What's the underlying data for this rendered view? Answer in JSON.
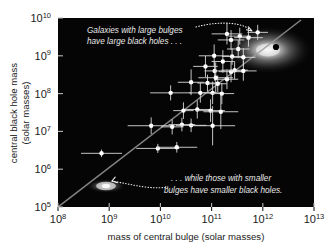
{
  "figure": {
    "name": "black-hole-mass-vs-bulge-mass-scatter",
    "background_color": "#ffffff",
    "plot_background_color": "#050505"
  },
  "axes": {
    "x_title": "mass of central bulge (solar masses)",
    "y_title_line1": "central black hole mass",
    "y_title_line2": "(solar masses)",
    "x_ticks": [
      {
        "mantissa": "10",
        "exponent": "8",
        "value": 8
      },
      {
        "mantissa": "10",
        "exponent": "9",
        "value": 9
      },
      {
        "mantissa": "10",
        "exponent": "10",
        "value": 10
      },
      {
        "mantissa": "10",
        "exponent": "11",
        "value": 11
      },
      {
        "mantissa": "10",
        "exponent": "12",
        "value": 12
      },
      {
        "mantissa": "10",
        "exponent": "13",
        "value": 13
      }
    ],
    "y_ticks": [
      {
        "mantissa": "10",
        "exponent": "10",
        "value": 10
      },
      {
        "mantissa": "10",
        "exponent": "9",
        "value": 9
      },
      {
        "mantissa": "10",
        "exponent": "8",
        "value": 8
      },
      {
        "mantissa": "10",
        "exponent": "7",
        "value": 7
      },
      {
        "mantissa": "10",
        "exponent": "6",
        "value": 6
      },
      {
        "mantissa": "10",
        "exponent": "5",
        "value": 5
      }
    ]
  },
  "annotations": {
    "top": {
      "line1": "Galaxies with large bulges",
      "line2": "have large black holes . . ."
    },
    "bottom": {
      "line1": ". . . while those with smaller",
      "line2": "bulges have smaller black holes."
    }
  },
  "chart_data": {
    "type": "scatter",
    "title": "",
    "xlabel": "mass of central bulge (solar masses)",
    "ylabel": "central black hole mass (solar masses)",
    "xscale": "log10",
    "yscale": "log10",
    "xlim": [
      8,
      13
    ],
    "ylim": [
      5,
      10
    ],
    "grid": false,
    "legend": null,
    "point_color": "#ffffff",
    "errorbar_color": "#d8d8d8",
    "fit_line": {
      "label": "best-fit relation",
      "color": "#9a9a9a",
      "x_log": [
        8.0,
        12.85
      ],
      "y_log": [
        5.0,
        9.95
      ]
    },
    "images": [
      {
        "name": "elliptical-galaxy-thumbnail",
        "x_log": 12.05,
        "y_log": 9.35,
        "note": "large elliptical galaxy with central black hole marker"
      },
      {
        "name": "spiral-galaxy-thumbnail",
        "x_log": 8.95,
        "y_log": 5.55,
        "note": "small spiral galaxy"
      }
    ],
    "points": [
      {
        "x_log": 8.85,
        "y_log": 6.42,
        "xerr": 0.4,
        "yerr": 0.1
      },
      {
        "x_log": 9.95,
        "y_log": 6.55,
        "xerr": 0.42,
        "yerr": 0.12
      },
      {
        "x_log": 10.32,
        "y_log": 6.58,
        "xerr": 0.4,
        "yerr": 0.14
      },
      {
        "x_log": 9.82,
        "y_log": 7.15,
        "xerr": 0.46,
        "yerr": 0.22
      },
      {
        "x_log": 10.23,
        "y_log": 7.12,
        "xerr": 0.22,
        "yerr": 0.2
      },
      {
        "x_log": 10.42,
        "y_log": 7.18,
        "xerr": 0.26,
        "yerr": 0.18
      },
      {
        "x_log": 10.6,
        "y_log": 7.16,
        "xerr": 0.3,
        "yerr": 0.18
      },
      {
        "x_log": 11.02,
        "y_log": 7.15,
        "xerr": 0.44,
        "yerr": 0.52
      },
      {
        "x_log": 10.45,
        "y_log": 7.55,
        "xerr": 0.2,
        "yerr": 0.22
      },
      {
        "x_log": 10.72,
        "y_log": 7.58,
        "xerr": 0.24,
        "yerr": 0.24
      },
      {
        "x_log": 10.98,
        "y_log": 7.55,
        "xerr": 0.28,
        "yerr": 0.3
      },
      {
        "x_log": 11.18,
        "y_log": 7.52,
        "xerr": 0.34,
        "yerr": 0.46
      },
      {
        "x_log": 10.2,
        "y_log": 8.02,
        "xerr": 0.4,
        "yerr": 0.2
      },
      {
        "x_log": 10.78,
        "y_log": 8.02,
        "xerr": 0.22,
        "yerr": 0.26
      },
      {
        "x_log": 11.02,
        "y_log": 8.02,
        "xerr": 0.2,
        "yerr": 0.3
      },
      {
        "x_log": 11.2,
        "y_log": 8.0,
        "xerr": 0.24,
        "yerr": 0.28
      },
      {
        "x_log": 10.6,
        "y_log": 8.3,
        "xerr": 0.26,
        "yerr": 0.34
      },
      {
        "x_log": 10.92,
        "y_log": 8.28,
        "xerr": 0.2,
        "yerr": 0.22
      },
      {
        "x_log": 11.12,
        "y_log": 8.26,
        "xerr": 0.18,
        "yerr": 0.22
      },
      {
        "x_log": 11.3,
        "y_log": 8.38,
        "xerr": 0.22,
        "yerr": 0.26
      },
      {
        "x_log": 11.06,
        "y_log": 8.6,
        "xerr": 0.2,
        "yerr": 0.26
      },
      {
        "x_log": 11.38,
        "y_log": 8.58,
        "xerr": 0.24,
        "yerr": 0.28
      },
      {
        "x_log": 11.22,
        "y_log": 8.85,
        "xerr": 0.22,
        "yerr": 0.3
      },
      {
        "x_log": 11.45,
        "y_log": 8.62,
        "xerr": 0.26,
        "yerr": 0.24
      },
      {
        "x_log": 11.62,
        "y_log": 8.6,
        "xerr": 0.26,
        "yerr": 0.26
      },
      {
        "x_log": 11.4,
        "y_log": 8.98,
        "xerr": 0.2,
        "yerr": 0.22
      },
      {
        "x_log": 11.05,
        "y_log": 9.0,
        "xerr": 0.3,
        "yerr": 0.3
      },
      {
        "x_log": 11.52,
        "y_log": 9.18,
        "xerr": 0.22,
        "yerr": 0.24
      },
      {
        "x_log": 11.38,
        "y_log": 9.42,
        "xerr": 0.26,
        "yerr": 0.26
      },
      {
        "x_log": 11.55,
        "y_log": 9.52,
        "xerr": 0.22,
        "yerr": 0.22
      },
      {
        "x_log": 11.72,
        "y_log": 9.48,
        "xerr": 0.28,
        "yerr": 0.24
      },
      {
        "x_log": 11.3,
        "y_log": 9.58,
        "xerr": 0.3,
        "yerr": 0.28
      },
      {
        "x_log": 11.08,
        "y_log": 8.42,
        "xerr": 0.34,
        "yerr": 0.4
      },
      {
        "x_log": 10.88,
        "y_log": 8.72,
        "xerr": 0.24,
        "yerr": 0.28
      },
      {
        "x_log": 11.62,
        "y_log": 8.96,
        "xerr": 0.24,
        "yerr": 0.24
      },
      {
        "x_log": 11.9,
        "y_log": 9.62,
        "xerr": 0.2,
        "yerr": 0.2
      },
      {
        "x_log": 12.18,
        "y_log": 9.4,
        "xerr": 0.0,
        "yerr": 0.0,
        "marker": "black-hole-dot"
      }
    ]
  }
}
